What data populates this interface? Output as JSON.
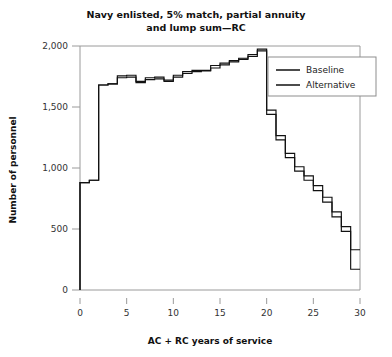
{
  "chart_data": {
    "type": "line",
    "title": "Navy enlisted, 5% match, partial annuity and lump sum—RC",
    "title_line1": "Navy enlisted, 5% match, partial annuity",
    "title_line2": "and lump sum—RC",
    "xlabel": "AC + RC years of service",
    "ylabel": "Number of personnel",
    "xlim": [
      0,
      30
    ],
    "ylim": [
      0,
      2000
    ],
    "xticks": [
      0,
      5,
      10,
      15,
      20,
      25,
      30
    ],
    "xtick_labels": [
      "0",
      "5",
      "10",
      "15",
      "20",
      "25",
      "30"
    ],
    "yticks": [
      0,
      500,
      1000,
      1500,
      2000
    ],
    "ytick_labels": [
      "0",
      "500",
      "1,000",
      "1,500",
      "2,000"
    ],
    "grid": false,
    "drawstyle": "steps-post",
    "legend_position": "upper right",
    "legend_entries": [
      "Baseline",
      "Alternative"
    ],
    "x": [
      0,
      1,
      2,
      3,
      4,
      5,
      6,
      7,
      8,
      9,
      10,
      11,
      12,
      13,
      14,
      15,
      16,
      17,
      18,
      19,
      20,
      21,
      22,
      23,
      24,
      25,
      26,
      27,
      28,
      29,
      30
    ],
    "series": [
      {
        "name": "Baseline",
        "color": "#111111",
        "values": [
          0,
          880,
          900,
          1680,
          1690,
          1755,
          1760,
          1710,
          1740,
          1745,
          1720,
          1760,
          1790,
          1800,
          1800,
          1840,
          1860,
          1880,
          1900,
          1930,
          1975,
          1475,
          1265,
          1120,
          1010,
          935,
          855,
          760,
          640,
          520,
          330
        ]
      },
      {
        "name": "Alternative",
        "color": "#111111",
        "values": [
          0,
          880,
          900,
          1680,
          1690,
          1740,
          1745,
          1700,
          1725,
          1730,
          1710,
          1745,
          1775,
          1790,
          1795,
          1820,
          1845,
          1870,
          1890,
          1915,
          1960,
          1440,
          1230,
          1085,
          975,
          900,
          815,
          720,
          600,
          480,
          170
        ]
      }
    ]
  }
}
